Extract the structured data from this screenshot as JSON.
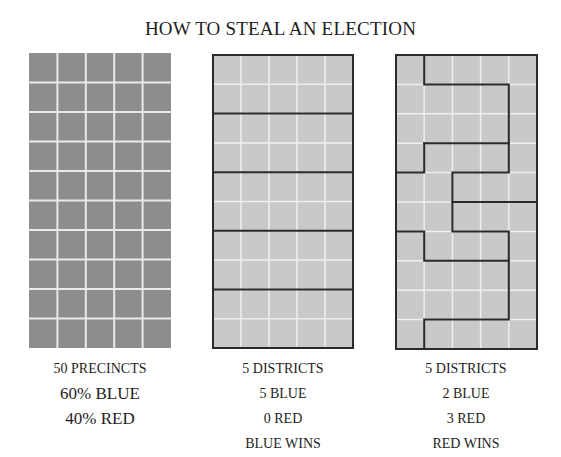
{
  "title": "HOW TO STEAL AN ELECTION",
  "panels": [
    {
      "id": "precincts",
      "grid": {
        "cols": 5,
        "rows": 10,
        "fill": "#8d8d8d",
        "gridline": "#e9e9e9",
        "district_lines": false
      },
      "captions": [
        "50 PRECINCTS",
        "60% BLUE",
        "40% RED"
      ]
    },
    {
      "id": "fair-districts",
      "grid": {
        "cols": 5,
        "rows": 10,
        "fill": "#c9c9c9",
        "gridline": "#efefef",
        "district_lines": true,
        "district_layout": "5 horizontal bands of 2 rows each"
      },
      "captions": [
        "5 DISTRICTS",
        "5 BLUE",
        "0 RED",
        "BLUE WINS"
      ]
    },
    {
      "id": "gerrymandered-districts",
      "grid": {
        "cols": 5,
        "rows": 10,
        "fill": "#c9c9c9",
        "gridline": "#efefef",
        "district_lines": true,
        "district_layout": "interlocking serpentine districts"
      },
      "captions": [
        "5 DISTRICTS",
        "2 BLUE",
        "3 RED",
        "RED WINS"
      ]
    }
  ],
  "colors": {
    "dark_fill": "#8d8d8d",
    "light_fill": "#c9c9c9",
    "border": "#2a2a2a",
    "gridline": "#eeeeee"
  }
}
